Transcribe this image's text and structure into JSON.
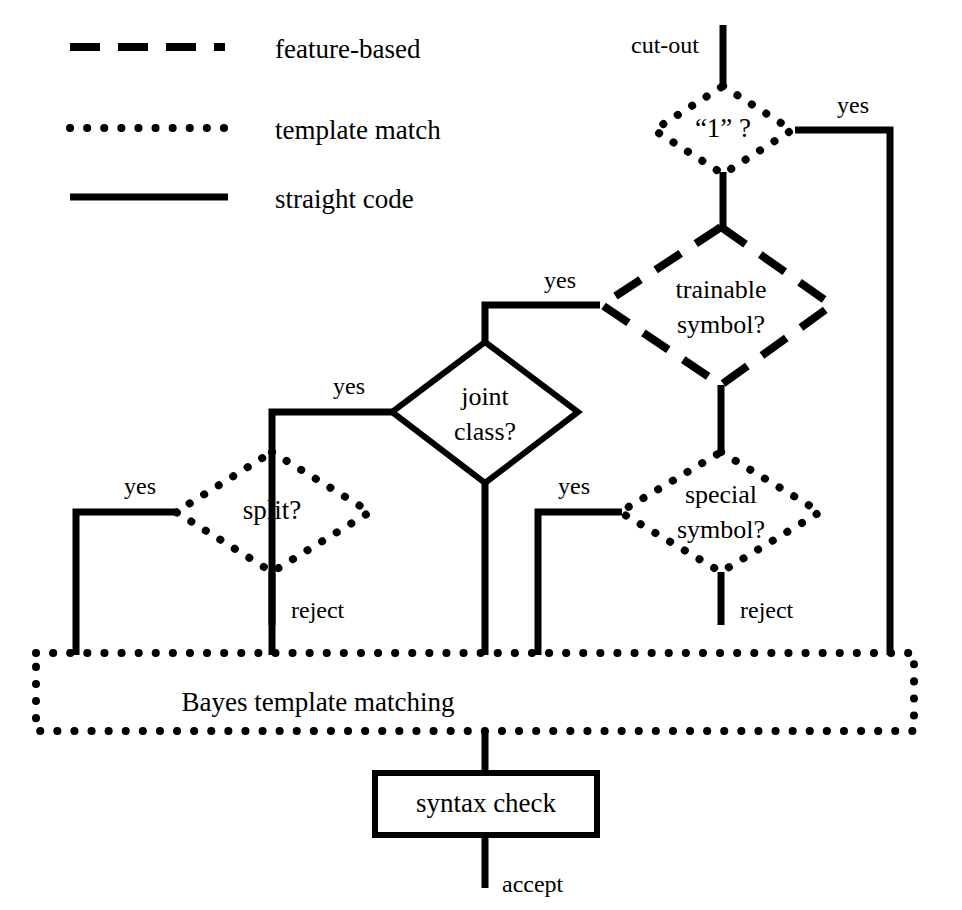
{
  "figure": {
    "kind": "flowchart",
    "background_color": "#ffffff",
    "line_color": "#000000"
  },
  "legend": {
    "items": [
      {
        "style": "dashed",
        "label": "feature-based"
      },
      {
        "style": "dotted",
        "label": "template match"
      },
      {
        "style": "solid",
        "label": "straight code"
      }
    ]
  },
  "nodes": {
    "cut_out": {
      "label": "cut-out",
      "shape": "label"
    },
    "one_q": {
      "label": "“1” ?",
      "shape": "diamond",
      "border": "dotted"
    },
    "trainable": {
      "label_line1": "trainable",
      "label_line2": "symbol?",
      "shape": "diamond",
      "border": "dashed"
    },
    "joint": {
      "label_line1": "joint",
      "label_line2": "class?",
      "shape": "diamond",
      "border": "solid"
    },
    "split": {
      "label": "split?",
      "shape": "diamond",
      "border": "dotted"
    },
    "special": {
      "label_line1": "special",
      "label_line2": "symbol?",
      "shape": "diamond",
      "border": "dotted"
    },
    "bayes": {
      "label": "Bayes template matching",
      "shape": "rect",
      "border": "dotted"
    },
    "syntax": {
      "label": "syntax check",
      "shape": "rect",
      "border": "solid"
    },
    "accept": {
      "label": "accept",
      "shape": "label"
    }
  },
  "edge_labels": {
    "one_q_yes": "yes",
    "trainable_yes": "yes",
    "joint_yes": "yes",
    "split_yes": "yes",
    "special_yes": "yes",
    "split_reject": "reject",
    "special_reject": "reject"
  }
}
